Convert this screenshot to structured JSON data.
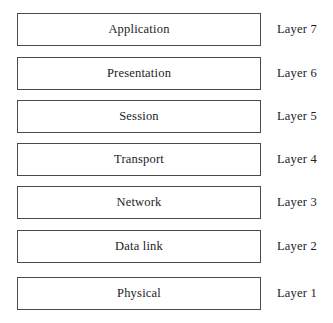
{
  "diagram": {
    "type": "stacked-layer-diagram",
    "background_color": "#ffffff",
    "box_border_color": "#4a4a4a",
    "box_fill_color": "#ffffff",
    "text_color": "#1c1c1c",
    "layers": [
      {
        "name": "Application",
        "side_label": "Layer 7",
        "number": 7
      },
      {
        "name": "Presentation",
        "side_label": "Layer 6",
        "number": 6
      },
      {
        "name": "Session",
        "side_label": "Layer 5",
        "number": 5
      },
      {
        "name": "Transport",
        "side_label": "Layer 4",
        "number": 4
      },
      {
        "name": "Network",
        "side_label": "Layer 3",
        "number": 3
      },
      {
        "name": "Data link",
        "side_label": "Layer 2",
        "number": 2
      },
      {
        "name": "Physical",
        "side_label": "Layer 1",
        "number": 1
      }
    ]
  }
}
